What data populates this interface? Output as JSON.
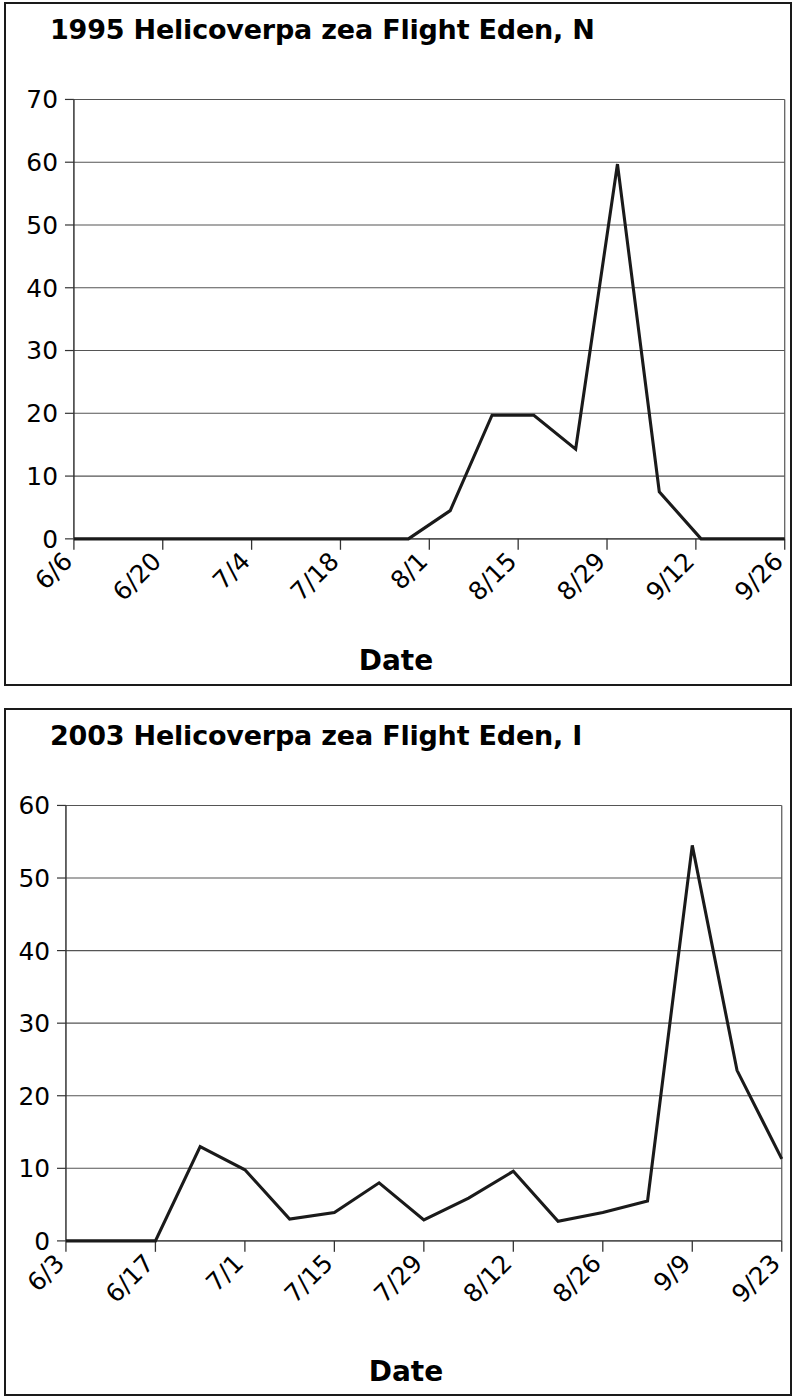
{
  "page": {
    "background": "#ffffff",
    "ink": "#000000"
  },
  "charts": [
    {
      "id": "chart1",
      "title": "1995 Helicoverpa zea Flight Eden, N",
      "title_truncated": true,
      "axis_title_x": "Date",
      "chart_data": {
        "type": "line",
        "title": "1995 Helicoverpa zea Flight Eden, N",
        "xlabel": "Date",
        "ylabel": "",
        "ylim": [
          0,
          70
        ],
        "ytick_labels": [
          "0",
          "10",
          "20",
          "30",
          "40",
          "50",
          "60",
          "70"
        ],
        "ytick_values": [
          0,
          10,
          20,
          30,
          40,
          50,
          60,
          70
        ],
        "xtick_labels": [
          "6/6",
          "6/20",
          "7/4",
          "7/18",
          "8/1",
          "8/15",
          "8/29",
          "9/12",
          "9/26"
        ],
        "grid": true,
        "legend": "none",
        "line_color": "#1a1a1a",
        "x": [
          "6/6",
          "6/13",
          "6/20",
          "6/27",
          "7/4",
          "7/11",
          "7/18",
          "7/25",
          "8/1",
          "8/8",
          "8/15",
          "8/22",
          "8/29",
          "9/5",
          "9/12",
          "9/19",
          "9/26",
          "10/3"
        ],
        "values": [
          0,
          0,
          0,
          0,
          0,
          0,
          0,
          0,
          0,
          4.5,
          19.7,
          19.7,
          14.3,
          59.7,
          7.5,
          0,
          0,
          0
        ]
      }
    },
    {
      "id": "chart2",
      "title": "2003 Helicoverpa zea Flight Eden, I",
      "title_truncated": true,
      "axis_title_x": "Date",
      "chart_data": {
        "type": "line",
        "title": "2003 Helicoverpa zea Flight Eden, I",
        "xlabel": "Date",
        "ylabel": "",
        "ylim": [
          0,
          60
        ],
        "ytick_labels": [
          "0",
          "10",
          "20",
          "30",
          "40",
          "50",
          "60"
        ],
        "ytick_values": [
          0,
          10,
          20,
          30,
          40,
          50,
          60
        ],
        "xtick_labels": [
          "6/3",
          "6/17",
          "7/1",
          "7/15",
          "7/29",
          "8/12",
          "8/26",
          "9/9",
          "9/23"
        ],
        "grid": true,
        "legend": "none",
        "line_color": "#1a1a1a",
        "x": [
          "6/3",
          "6/10",
          "6/17",
          "6/24",
          "7/1",
          "7/8",
          "7/15",
          "7/22",
          "7/29",
          "8/5",
          "8/12",
          "8/19",
          "8/26",
          "9/2",
          "9/9",
          "9/16",
          "9/23"
        ],
        "values": [
          0,
          0,
          0,
          13.0,
          9.8,
          3.0,
          3.9,
          8.0,
          2.9,
          5.9,
          9.6,
          2.7,
          3.9,
          5.5,
          54.5,
          23.5,
          11.3
        ]
      }
    }
  ]
}
